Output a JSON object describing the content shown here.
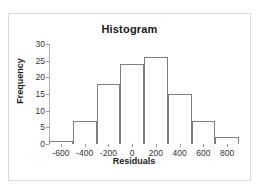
{
  "chart_data": {
    "type": "bar",
    "title": "Histogram",
    "xlabel": "Residuals",
    "ylabel": "Frequency",
    "bin_width": 200,
    "bin_edges": [
      -700,
      -500,
      -300,
      -100,
      100,
      300,
      500,
      700,
      900
    ],
    "bin_centers": [
      -600,
      -400,
      -200,
      0,
      200,
      400,
      600,
      800
    ],
    "categories": [
      "-600",
      "-400",
      "-200",
      "0",
      "200",
      "400",
      "600",
      "800"
    ],
    "values": [
      1,
      7,
      18,
      24,
      26,
      15,
      7,
      2
    ],
    "xtick_labels": [
      "-600",
      "-400",
      "-200",
      "0",
      "200",
      "400",
      "600",
      "800"
    ],
    "ytick_labels": [
      "0",
      "5",
      "10",
      "15",
      "20",
      "25",
      "30"
    ],
    "ytick_values": [
      0,
      5,
      10,
      15,
      20,
      25,
      30
    ],
    "xlim": [
      -700,
      900
    ],
    "ylim": [
      0,
      30
    ],
    "grid": false,
    "legend": false,
    "bar_fill_color": "#ffffff",
    "bar_edge_color": "#808080",
    "axis_color": "#808080",
    "text_color": "#1a1a1a",
    "frame_border_color": "#d9d9d9",
    "background_color": "#ffffff"
  }
}
